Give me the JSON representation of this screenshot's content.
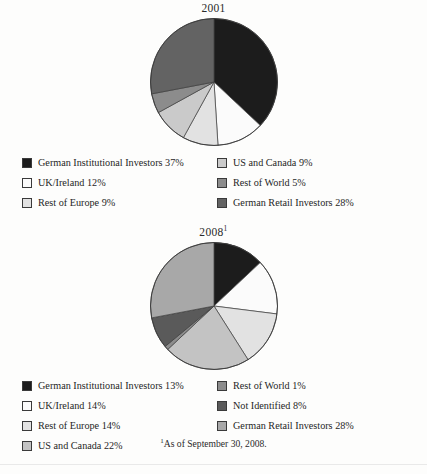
{
  "figure": {
    "footnote_marker": "1",
    "footnote_text": "As of September 30, 2008.",
    "bottom_partial_text": ""
  },
  "charts": [
    {
      "id": "pie-2001",
      "title": "2001",
      "title_superscript": "",
      "legend": [
        {
          "label": "German Institutional Investors 37%",
          "color": "#1c1c1c"
        },
        {
          "label": "US and Canada 9%",
          "color": "#cacaca"
        },
        {
          "label": "UK/Ireland 12%",
          "color": "#fbfbfb"
        },
        {
          "label": "Rest of World 5%",
          "color": "#8c8c8c"
        },
        {
          "label": "Rest of Europe 9%",
          "color": "#e2e2e2"
        },
        {
          "label": "German Retail Investors 28%",
          "color": "#636363"
        }
      ]
    },
    {
      "id": "pie-2008",
      "title": "2008",
      "title_superscript": "1",
      "legend": [
        {
          "label": "German Institutional Investors 13%",
          "color": "#1c1c1c"
        },
        {
          "label": "Rest of World 1%",
          "color": "#8c8c8c"
        },
        {
          "label": "UK/Ireland 14%",
          "color": "#fbfbfb"
        },
        {
          "label": "Not Identified 8%",
          "color": "#5a5a5a"
        },
        {
          "label": "Rest of Europe 14%",
          "color": "#e2e2e2"
        },
        {
          "label": "German Retail Investors 28%",
          "color": "#a8a8a8"
        },
        {
          "label": "US and Canada 22%",
          "color": "#c3c3c3"
        }
      ]
    }
  ],
  "chart_data": [
    {
      "type": "pie",
      "title": "2001",
      "xlabel": "",
      "ylabel": "",
      "start_angle_deg": 0,
      "direction": "clockwise",
      "legend_position": "below",
      "units": "percent",
      "categories": [
        "German Institutional Investors",
        "UK/Ireland",
        "Rest of Europe",
        "US and Canada",
        "Rest of World",
        "German Retail Investors"
      ],
      "values": [
        37,
        12,
        9,
        9,
        5,
        28
      ],
      "colors": [
        "#1c1c1c",
        "#fbfbfb",
        "#e2e2e2",
        "#cacaca",
        "#8c8c8c",
        "#636363"
      ],
      "slices": [
        {
          "label": "German Institutional Investors",
          "value": 37,
          "color": "#1c1c1c"
        },
        {
          "label": "UK/Ireland",
          "value": 12,
          "color": "#fbfbfb"
        },
        {
          "label": "Rest of Europe",
          "value": 9,
          "color": "#e2e2e2"
        },
        {
          "label": "US and Canada",
          "value": 9,
          "color": "#cacaca"
        },
        {
          "label": "Rest of World",
          "value": 5,
          "color": "#8c8c8c"
        },
        {
          "label": "German Retail Investors",
          "value": 28,
          "color": "#636363"
        }
      ]
    },
    {
      "type": "pie",
      "title": "2008",
      "xlabel": "",
      "ylabel": "",
      "start_angle_deg": 0,
      "direction": "clockwise",
      "legend_position": "below",
      "units": "percent",
      "categories": [
        "German Institutional Investors",
        "UK/Ireland",
        "Rest of Europe",
        "US and Canada",
        "Rest of World",
        "Not Identified",
        "German Retail Investors"
      ],
      "values": [
        13,
        14,
        14,
        22,
        1,
        8,
        28
      ],
      "colors": [
        "#1c1c1c",
        "#fbfbfb",
        "#e2e2e2",
        "#c3c3c3",
        "#8c8c8c",
        "#5a5a5a",
        "#a8a8a8"
      ],
      "slices": [
        {
          "label": "German Institutional Investors",
          "value": 13,
          "color": "#1c1c1c"
        },
        {
          "label": "UK/Ireland",
          "value": 14,
          "color": "#fbfbfb"
        },
        {
          "label": "Rest of Europe",
          "value": 14,
          "color": "#e2e2e2"
        },
        {
          "label": "US and Canada",
          "value": 22,
          "color": "#c3c3c3"
        },
        {
          "label": "Rest of World",
          "value": 1,
          "color": "#8c8c8c"
        },
        {
          "label": "Not Identified",
          "value": 8,
          "color": "#5a5a5a"
        },
        {
          "label": "German Retail Investors",
          "value": 28,
          "color": "#a8a8a8"
        }
      ]
    }
  ]
}
